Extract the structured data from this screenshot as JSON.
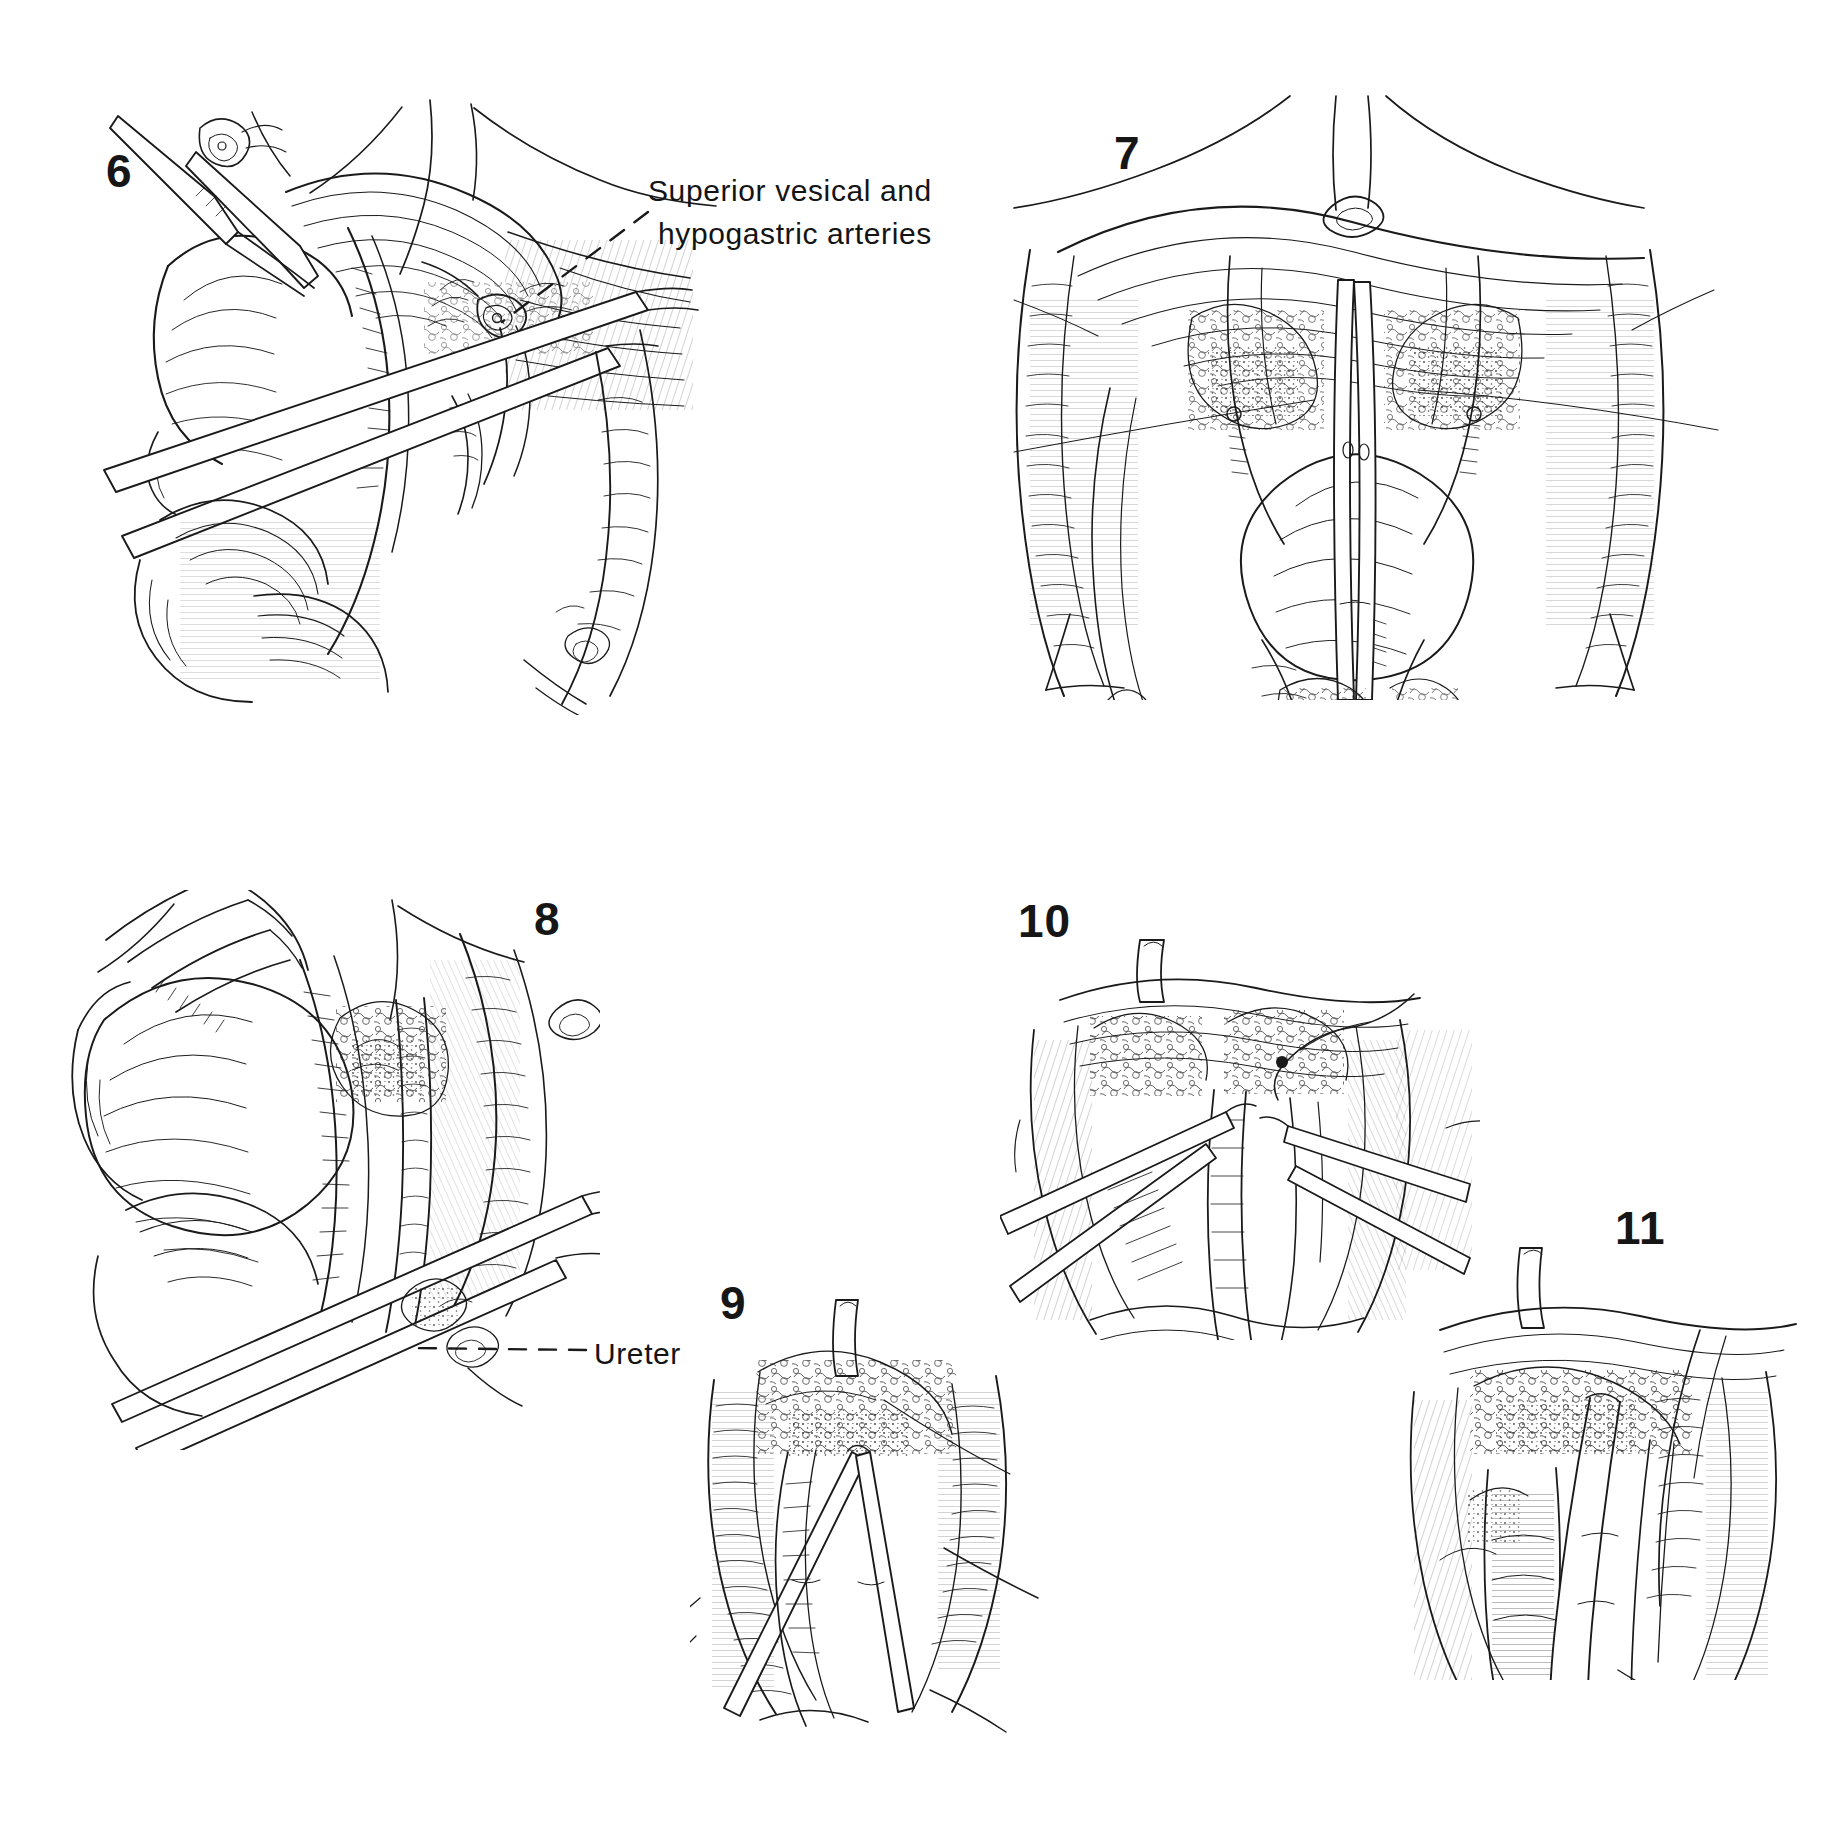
{
  "plate": {
    "kind": "surgical-atlas-plate",
    "background_color": "#ffffff",
    "ink_color": "#1a1a1a",
    "figure_count": 6
  },
  "figures": [
    {
      "id": "fig-6",
      "number": "6",
      "caption_x": 106,
      "caption_y": 148
    },
    {
      "id": "fig-7",
      "number": "7",
      "caption_x": 1114,
      "caption_y": 130
    },
    {
      "id": "fig-8",
      "number": "8",
      "caption_x": 534,
      "caption_y": 896
    },
    {
      "id": "fig-9",
      "number": "9",
      "caption_x": 720,
      "caption_y": 1280
    },
    {
      "id": "fig-10",
      "number": "10",
      "caption_x": 1018,
      "caption_y": 898
    },
    {
      "id": "fig-11",
      "number": "11",
      "caption_x": 1615,
      "caption_y": 1205
    }
  ],
  "annotations": {
    "superior_vesical": {
      "line1": "Superior vesical and",
      "line2": "hypogastric arteries",
      "leader": "dashed",
      "figure": "6"
    },
    "ureter": {
      "label": "Ureter",
      "leader": "dashed",
      "figure": "8"
    }
  }
}
